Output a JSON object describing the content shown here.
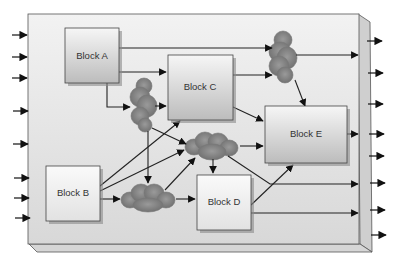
{
  "diagram": {
    "type": "block-diagram",
    "board": {
      "x": 27,
      "y": 14,
      "w": 333,
      "h": 230
    },
    "blocks": [
      {
        "id": "A",
        "label": "Block A",
        "x": 65,
        "y": 28,
        "w": 54,
        "h": 55
      },
      {
        "id": "B",
        "label": "Block B",
        "x": 46,
        "y": 166,
        "w": 54,
        "h": 55
      },
      {
        "id": "C",
        "label": "Block C",
        "x": 168,
        "y": 55,
        "w": 65,
        "h": 65
      },
      {
        "id": "D",
        "label": "Block D",
        "x": 197,
        "y": 175,
        "w": 54,
        "h": 55
      },
      {
        "id": "E",
        "label": "Block E",
        "x": 265,
        "y": 106,
        "w": 82,
        "h": 57
      }
    ],
    "clouds": [
      {
        "id": "cloud-top-right",
        "cx": 283,
        "cy": 58,
        "rx": 13,
        "ry": 26
      },
      {
        "id": "cloud-left",
        "cx": 143,
        "cy": 105,
        "rx": 12,
        "ry": 26
      },
      {
        "id": "cloud-center",
        "cx": 213,
        "cy": 146,
        "rx": 27,
        "ry": 14
      },
      {
        "id": "cloud-bottom",
        "cx": 148,
        "cy": 199,
        "rx": 27,
        "ry": 13
      }
    ],
    "inputs_y": [
      35,
      57,
      78,
      111,
      144,
      178,
      198,
      218
    ],
    "outputs_y": [
      41,
      73,
      104,
      134,
      156,
      183,
      210,
      235
    ],
    "colors": {
      "board_fill": "#e4e4e4",
      "board_edge": "#c8c8c8",
      "block_top": "#f4f4f4",
      "block_bottom": "#bdbdbd",
      "cloud": "#8a8a8a",
      "line": "#222222"
    }
  }
}
